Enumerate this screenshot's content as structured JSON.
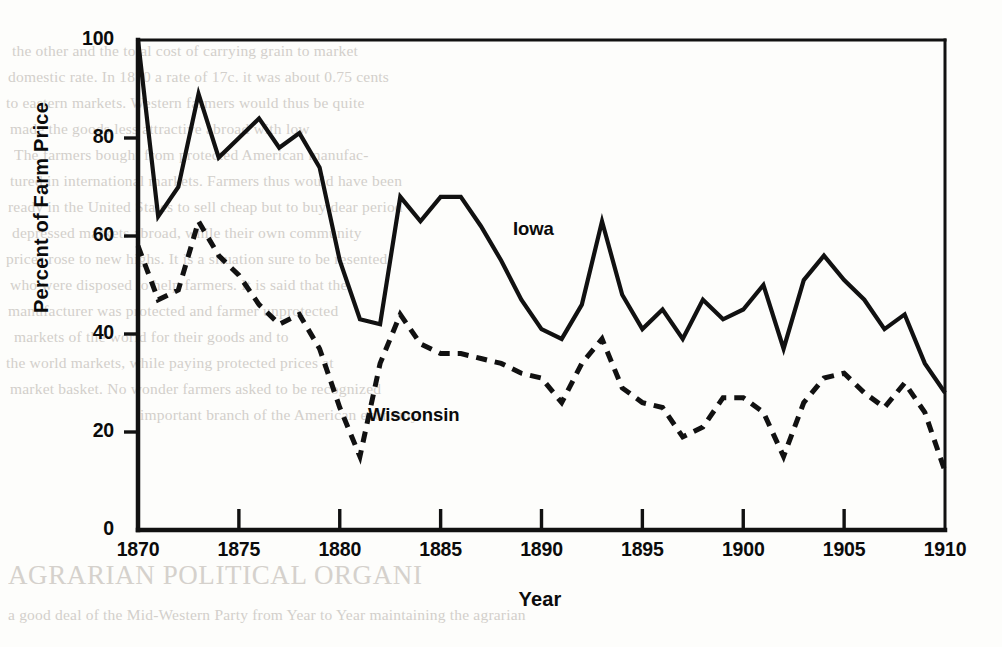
{
  "figure": {
    "ylabel": "Percent of Farm Price",
    "xlabel": "Year",
    "ink_color": "#111111",
    "series_labels": {
      "iowa": "Iowa",
      "wisconsin": "Wisconsin"
    }
  },
  "chart_data": {
    "type": "line",
    "title": "",
    "xlabel": "Year",
    "ylabel": "Percent of Farm Price",
    "xlim": [
      1870,
      1910
    ],
    "ylim": [
      0,
      100
    ],
    "xticks": [
      1870,
      1875,
      1880,
      1885,
      1890,
      1895,
      1900,
      1905,
      1910
    ],
    "yticks": [
      0,
      20,
      40,
      60,
      80,
      100
    ],
    "grid": false,
    "legend": "inline-annotation",
    "x": [
      1870,
      1871,
      1872,
      1873,
      1874,
      1875,
      1876,
      1877,
      1878,
      1879,
      1880,
      1881,
      1882,
      1883,
      1884,
      1885,
      1886,
      1887,
      1888,
      1889,
      1890,
      1891,
      1892,
      1893,
      1894,
      1895,
      1896,
      1897,
      1898,
      1899,
      1900,
      1901,
      1902,
      1903,
      1904,
      1905,
      1906,
      1907,
      1908,
      1909,
      1910
    ],
    "series": [
      {
        "name": "Iowa",
        "linestyle": "solid",
        "color": "#111111",
        "values": [
          100,
          64,
          70,
          89,
          76,
          80,
          84,
          78,
          81,
          74,
          55,
          43,
          42,
          68,
          63,
          68,
          68,
          62,
          55,
          47,
          41,
          39,
          46,
          63,
          48,
          41,
          45,
          39,
          47,
          43,
          45,
          50,
          37,
          51,
          56,
          51,
          47,
          41,
          44,
          34,
          28
        ]
      },
      {
        "name": "Wisconsin",
        "linestyle": "dashed",
        "color": "#111111",
        "values": [
          58,
          47,
          49,
          63,
          56,
          52,
          46,
          42,
          44,
          37,
          25,
          15,
          34,
          44,
          38,
          36,
          36,
          35,
          34,
          32,
          31,
          26,
          34,
          39,
          29,
          26,
          25,
          19,
          21,
          27,
          27,
          24,
          15,
          26,
          31,
          32,
          28,
          25,
          30,
          24,
          12
        ]
      }
    ]
  },
  "bleed_text": {
    "headline": "AGRARIAN POLITICAL ORGANI",
    "lines": [
      "the other and the total cost of carrying grain to market",
      "domestic rate. In 1870 a rate of 17c. it was about 0.75 cents",
      "to eastern markets. Western farmers would thus be quite",
      "made the goods less attractive abroad with low",
      "The farmers bought from protected American manufac-",
      "tured in international markets. Farmers thus would have been",
      "ready in the United States to sell cheap but to buy dear period",
      "depressed markets abroad, while their own community",
      "prices rose to new highs. It is a situation sure to be resented",
      "who were disposed to help farmers. It is said that the",
      "manufacturer was protected and farmer unprotected",
      "markets of the world for their goods and to",
      "the world markets, while paying protected prices at",
      "market basket. No wonder farmers asked to be recognized",
      "important branch of the American economy"
    ],
    "bottom_line": "a good deal of the Mid-Western Party from Year to Year maintaining the agrarian"
  }
}
